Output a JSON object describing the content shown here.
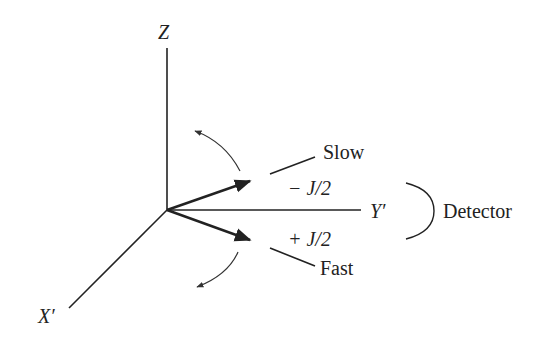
{
  "diagram": {
    "axes": {
      "z_label": "Z",
      "y_label": "Y′",
      "x_label": "X′"
    },
    "labels": {
      "slow": "Slow",
      "fast": "Fast",
      "minus_j": "− J/2",
      "plus_j": "+ J/2",
      "detector": "Detector"
    },
    "colors": {
      "line": "#222222",
      "background": "#ffffff"
    }
  }
}
